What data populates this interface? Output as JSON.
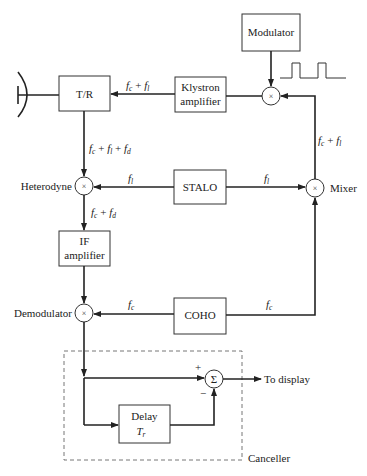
{
  "diagram": {
    "blocks": {
      "modulator": "Modulator",
      "klystron_line1": "Klystron",
      "klystron_line2": "amplifier",
      "tr": "T/R",
      "stalo": "STALO",
      "if_line1": "IF",
      "if_line2": "amplifier",
      "coho": "COHO",
      "delay_line1": "Delay",
      "delay_T": "T",
      "delay_sub": "r"
    },
    "nodes": {
      "multiply_symbol": "×",
      "sum_symbol": "Σ",
      "heterodyne": "Heterodyne",
      "mixer": "Mixer",
      "demodulator": "Demodulator",
      "plus": "+",
      "minus": "−"
    },
    "signals": {
      "f": "f",
      "c": "c",
      "l": "l",
      "d": "d",
      "plus_sep": " + "
    },
    "outputs": {
      "to_display": "To display",
      "canceller": "Canceller"
    },
    "colors": {
      "line": "#222222",
      "box_border": "#333333",
      "dashed_border": "#666666",
      "background": "#ffffff"
    }
  }
}
